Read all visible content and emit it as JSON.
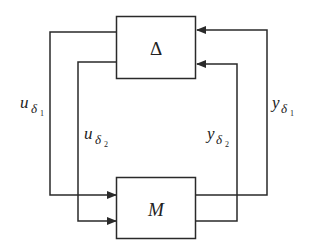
{
  "diagram": {
    "blocks": {
      "delta": {
        "label": "Δ"
      },
      "m": {
        "label": "M"
      }
    },
    "signals": {
      "u1": {
        "base": "u",
        "sub": "δ",
        "subsub": "1"
      },
      "u2": {
        "base": "u",
        "sub": "δ",
        "subsub": "2"
      },
      "y1": {
        "base": "y",
        "sub": "δ",
        "subsub": "1"
      },
      "y2": {
        "base": "y",
        "sub": "δ",
        "subsub": "2"
      }
    },
    "colors": {
      "line": "#2a2a2a",
      "background": "#ffffff"
    }
  }
}
